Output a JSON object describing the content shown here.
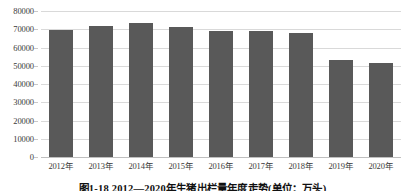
{
  "figure": {
    "caption": "图1-18  2012—2020年生猪出栏量年度走势(单位：万头)",
    "background_color": "#ffffff",
    "bar_color": "#595959",
    "gridline_color": "#d9d9d9",
    "text_color": "#3a3a3a"
  },
  "chart_data": {
    "type": "bar",
    "title": "图1-18  2012—2020年生猪出栏量年度走势(单位：万头)",
    "xlabel": "",
    "ylabel": "",
    "categories": [
      "2012年",
      "2013年",
      "2014年",
      "2015年",
      "2016年",
      "2017年",
      "2018年",
      "2019年",
      "2020年"
    ],
    "values": [
      69500,
      71600,
      73500,
      71200,
      68800,
      68900,
      68000,
      53200,
      51500
    ],
    "series": [
      {
        "name": "生猪出栏量",
        "values": [
          69500,
          71600,
          73500,
          71200,
          68800,
          68900,
          68000,
          53200,
          51500
        ]
      }
    ],
    "ylim": [
      0,
      80000
    ],
    "ytick_labels": [
      "0",
      "10000",
      "20000",
      "30000",
      "40000",
      "50000",
      "60000",
      "70000",
      "80000"
    ],
    "ytick_values": [
      0,
      10000,
      20000,
      30000,
      40000,
      50000,
      60000,
      70000,
      80000
    ],
    "grid": true,
    "grid_axis": "y",
    "legend": false,
    "legend_position": "none",
    "units": "万头",
    "annotations": []
  }
}
